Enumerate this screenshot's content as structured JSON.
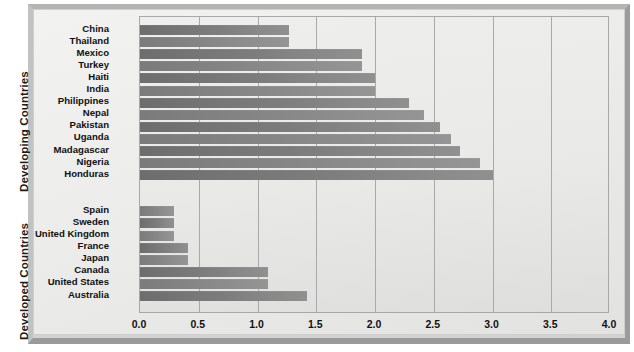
{
  "chart_data": {
    "type": "bar",
    "orientation": "horizontal",
    "title": "",
    "xlabel": "",
    "ylabel": "",
    "xlim": [
      0.0,
      4.0
    ],
    "xticks": [
      "0.0",
      "0.5",
      "1.0",
      "1.5",
      "2.0",
      "2.5",
      "3.0",
      "3.5",
      "4.0"
    ],
    "xtick_values": [
      0.0,
      0.5,
      1.0,
      1.5,
      2.0,
      2.5,
      3.0,
      3.5,
      4.0
    ],
    "grid": "vertical",
    "legend": "none",
    "groups": [
      {
        "name": "Developing Countries",
        "categories": [
          "China",
          "Thailand",
          "Mexico",
          "Turkey",
          "Haiti",
          "India",
          "Philippines",
          "Nepal",
          "Pakistan",
          "Uganda",
          "Madagascar",
          "Nigeria",
          "Honduras"
        ],
        "values": [
          1.27,
          1.27,
          1.89,
          1.89,
          2.0,
          2.0,
          2.29,
          2.42,
          2.55,
          2.65,
          2.72,
          2.89,
          3.0
        ]
      },
      {
        "name": "Developed Countries",
        "categories": [
          "Spain",
          "Sweden",
          "United Kingdom",
          "France",
          "Japan",
          "Canada",
          "United States",
          "Australia"
        ],
        "values": [
          0.29,
          0.29,
          0.29,
          0.41,
          0.41,
          1.09,
          1.09,
          1.42
        ]
      }
    ],
    "colors": {
      "bar_dark": "#7d7d7d",
      "bar_light": "#8d8d8d",
      "plot_background": "#e9e9e7",
      "frame_background": "#d2d2d2",
      "gridline": "#a9a9a9",
      "text": "#111111"
    }
  }
}
